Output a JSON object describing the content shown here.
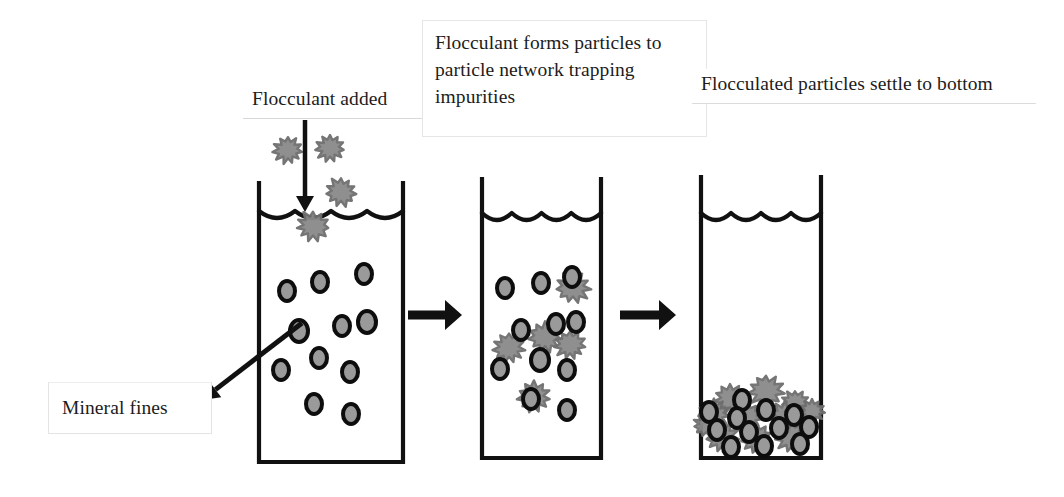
{
  "diagram": {
    "width": 1064,
    "height": 497,
    "background_color": "#ffffff"
  },
  "colors": {
    "outline": "#111111",
    "floc_fill": "#8a8a8a",
    "floc_stroke": "#6e6e6e",
    "fine_fill": "#9a9a9a",
    "fine_stroke": "#0d0d0d",
    "callout_border": "#e6e6e6",
    "text": "#1c1c1c"
  },
  "callouts": [
    {
      "id": "flocculant-added",
      "text": "Flocculant added",
      "x": 243,
      "y": 84,
      "width": 183,
      "height": 35,
      "boxed": false
    },
    {
      "id": "network",
      "text": "Flocculant forms particles to particle network trapping impurities",
      "x": 422,
      "y": 20,
      "width": 285,
      "height": 117,
      "boxed": true
    },
    {
      "id": "settle",
      "text": "Flocculated particles settle to bottom",
      "x": 692,
      "y": 69,
      "width": 344,
      "height": 35,
      "boxed": false
    },
    {
      "id": "mineral-fines",
      "text": "Mineral fines",
      "x": 48,
      "y": 382,
      "width": 164,
      "height": 52,
      "boxed": true
    }
  ],
  "beakers": [
    {
      "id": "beaker-1",
      "label": "Flocculant added stage",
      "left": 259,
      "right": 403,
      "top": 183,
      "bottom": 462,
      "water_line_y": 214,
      "wave_count": 3
    },
    {
      "id": "beaker-2",
      "label": "Network forming stage",
      "left": 482,
      "right": 601,
      "top": 179,
      "bottom": 458,
      "water_line_y": 216,
      "wave_count": 3
    },
    {
      "id": "beaker-3",
      "label": "Settled stage",
      "left": 701,
      "right": 821,
      "top": 177,
      "bottom": 458,
      "water_line_y": 216,
      "wave_count": 3
    }
  ],
  "process_arrows": [
    {
      "id": "arrow-stage-1-to-2",
      "x1": 408,
      "y1": 315,
      "x2": 462,
      "y2": 315
    },
    {
      "id": "arrow-stage-2-to-3",
      "x1": 620,
      "y1": 315,
      "x2": 676,
      "y2": 315
    }
  ],
  "dosing_arrow": {
    "id": "flocculant-dosing-arrow",
    "x1": 305,
    "y1": 120,
    "x2": 305,
    "y2": 212
  },
  "pointer_arrow": {
    "id": "mineral-fines-pointer",
    "x1": 302,
    "y1": 323,
    "x2": 202,
    "y2": 400
  },
  "flocs_added": [
    {
      "cx": 288,
      "cy": 150,
      "r": 14
    },
    {
      "cx": 330,
      "cy": 148,
      "r": 14
    },
    {
      "cx": 341,
      "cy": 192,
      "r": 15
    },
    {
      "cx": 313,
      "cy": 226,
      "r": 16
    }
  ],
  "fines_beaker_1": [
    {
      "cx": 287,
      "cy": 291,
      "rx": 8,
      "ry": 10
    },
    {
      "cx": 320,
      "cy": 282,
      "rx": 8,
      "ry": 10
    },
    {
      "cx": 364,
      "cy": 274,
      "rx": 8,
      "ry": 10
    },
    {
      "cx": 299,
      "cy": 331,
      "rx": 9,
      "ry": 11
    },
    {
      "cx": 342,
      "cy": 326,
      "rx": 8,
      "ry": 10
    },
    {
      "cx": 367,
      "cy": 322,
      "rx": 9,
      "ry": 11
    },
    {
      "cx": 319,
      "cy": 358,
      "rx": 8,
      "ry": 10
    },
    {
      "cx": 281,
      "cy": 370,
      "rx": 8,
      "ry": 10
    },
    {
      "cx": 350,
      "cy": 372,
      "rx": 8,
      "ry": 10
    },
    {
      "cx": 314,
      "cy": 404,
      "rx": 8,
      "ry": 10
    },
    {
      "cx": 351,
      "cy": 414,
      "rx": 8,
      "ry": 10
    }
  ],
  "flocs_beaker_2": [
    {
      "cx": 573,
      "cy": 287,
      "r": 17
    },
    {
      "cx": 545,
      "cy": 337,
      "r": 16
    },
    {
      "cx": 570,
      "cy": 345,
      "r": 15
    },
    {
      "cx": 509,
      "cy": 348,
      "r": 16
    },
    {
      "cx": 534,
      "cy": 397,
      "r": 16
    }
  ],
  "fines_beaker_2": [
    {
      "cx": 505,
      "cy": 288,
      "rx": 8,
      "ry": 10
    },
    {
      "cx": 541,
      "cy": 283,
      "rx": 8,
      "ry": 10
    },
    {
      "cx": 572,
      "cy": 277,
      "rx": 8,
      "ry": 10
    },
    {
      "cx": 521,
      "cy": 330,
      "rx": 8,
      "ry": 10
    },
    {
      "cx": 556,
      "cy": 324,
      "rx": 8,
      "ry": 10
    },
    {
      "cx": 576,
      "cy": 322,
      "rx": 8,
      "ry": 10
    },
    {
      "cx": 540,
      "cy": 360,
      "rx": 9,
      "ry": 11
    },
    {
      "cx": 500,
      "cy": 369,
      "rx": 8,
      "ry": 10
    },
    {
      "cx": 567,
      "cy": 370,
      "rx": 8,
      "ry": 10
    },
    {
      "cx": 531,
      "cy": 399,
      "rx": 8,
      "ry": 10
    },
    {
      "cx": 567,
      "cy": 410,
      "rx": 8,
      "ry": 10
    }
  ],
  "sediment_flocs_beaker_3": [
    {
      "cx": 730,
      "cy": 399,
      "r": 15
    },
    {
      "cx": 766,
      "cy": 391,
      "r": 17
    },
    {
      "cx": 795,
      "cy": 403,
      "r": 13
    },
    {
      "cx": 714,
      "cy": 414,
      "r": 15
    },
    {
      "cx": 748,
      "cy": 417,
      "r": 14
    },
    {
      "cx": 785,
      "cy": 417,
      "r": 16
    },
    {
      "cx": 812,
      "cy": 411,
      "r": 12
    },
    {
      "cx": 722,
      "cy": 437,
      "r": 16
    },
    {
      "cx": 757,
      "cy": 439,
      "r": 15
    },
    {
      "cx": 792,
      "cy": 437,
      "r": 16
    },
    {
      "cx": 706,
      "cy": 425,
      "r": 12
    }
  ],
  "sediment_fines_beaker_3": [
    {
      "cx": 742,
      "cy": 400,
      "rx": 8,
      "ry": 10
    },
    {
      "cx": 709,
      "cy": 412,
      "rx": 8,
      "ry": 10
    },
    {
      "cx": 737,
      "cy": 418,
      "rx": 8,
      "ry": 10
    },
    {
      "cx": 766,
      "cy": 410,
      "rx": 8,
      "ry": 10
    },
    {
      "cx": 794,
      "cy": 415,
      "rx": 8,
      "ry": 10
    },
    {
      "cx": 717,
      "cy": 430,
      "rx": 8,
      "ry": 10
    },
    {
      "cx": 749,
      "cy": 432,
      "rx": 8,
      "ry": 10
    },
    {
      "cx": 779,
      "cy": 428,
      "rx": 8,
      "ry": 10
    },
    {
      "cx": 809,
      "cy": 427,
      "rx": 8,
      "ry": 10
    },
    {
      "cx": 731,
      "cy": 447,
      "rx": 8,
      "ry": 10
    },
    {
      "cx": 764,
      "cy": 446,
      "rx": 8,
      "ry": 10
    },
    {
      "cx": 800,
      "cy": 444,
      "rx": 8,
      "ry": 10
    }
  ]
}
